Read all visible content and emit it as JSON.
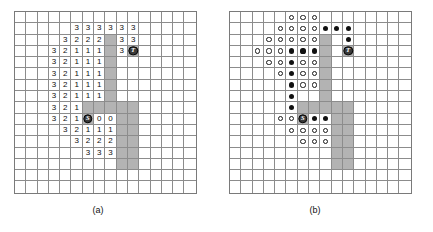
{
  "figure": {
    "panels": [
      {
        "id": "a",
        "caption": "(a)",
        "grid": {
          "cols": 16,
          "rows": 16,
          "cells": [
            [
              null,
              null,
              null,
              null,
              null,
              null,
              null,
              null,
              null,
              null,
              null,
              null,
              null,
              null,
              null,
              null
            ],
            [
              null,
              null,
              null,
              null,
              null,
              "3",
              "3",
              "3",
              "3",
              "3",
              "3",
              null,
              null,
              null,
              null,
              null
            ],
            [
              null,
              null,
              null,
              null,
              "3",
              "2",
              "2",
              "2",
              "#",
              "3",
              "3",
              null,
              null,
              null,
              null,
              null
            ],
            [
              null,
              null,
              null,
              "3",
              "2",
              "1",
              "1",
              "1",
              "#",
              "3",
              "T",
              null,
              null,
              null,
              null,
              null
            ],
            [
              null,
              null,
              null,
              "3",
              "2",
              "1",
              "1",
              "1",
              "#",
              null,
              null,
              null,
              null,
              null,
              null,
              null
            ],
            [
              null,
              null,
              null,
              "3",
              "2",
              "1",
              "1",
              "1",
              "#",
              null,
              null,
              null,
              null,
              null,
              null,
              null
            ],
            [
              null,
              null,
              null,
              "3",
              "2",
              "1",
              "1",
              "1",
              "#",
              null,
              null,
              null,
              null,
              null,
              null,
              null
            ],
            [
              null,
              null,
              null,
              "3",
              "2",
              "1",
              "1",
              "1",
              "#",
              null,
              null,
              null,
              null,
              null,
              null,
              null
            ],
            [
              null,
              null,
              null,
              "3",
              "2",
              "1",
              "#",
              "#",
              "#",
              "#",
              "#",
              null,
              null,
              null,
              null,
              null
            ],
            [
              null,
              null,
              null,
              "3",
              "2",
              "1",
              "S",
              "0",
              "0",
              "#",
              "#",
              null,
              null,
              null,
              null,
              null
            ],
            [
              null,
              null,
              null,
              null,
              "3",
              "2",
              "1",
              "1",
              "1",
              "#",
              "#",
              null,
              null,
              null,
              null,
              null
            ],
            [
              null,
              null,
              null,
              null,
              null,
              "3",
              "2",
              "2",
              "2",
              "#",
              "#",
              null,
              null,
              null,
              null,
              null
            ],
            [
              null,
              null,
              null,
              null,
              null,
              null,
              "3",
              "3",
              "3",
              "#",
              "#",
              null,
              null,
              null,
              null,
              null
            ],
            [
              null,
              null,
              null,
              null,
              null,
              null,
              null,
              null,
              null,
              "#",
              "#",
              null,
              null,
              null,
              null,
              null
            ],
            [
              null,
              null,
              null,
              null,
              null,
              null,
              null,
              null,
              null,
              null,
              null,
              null,
              null,
              null,
              null,
              null
            ],
            [
              null,
              null,
              null,
              null,
              null,
              null,
              null,
              null,
              null,
              null,
              null,
              null,
              null,
              null,
              null,
              null
            ]
          ]
        }
      },
      {
        "id": "b",
        "caption": "(b)",
        "grid": {
          "cols": 16,
          "rows": 16,
          "cells": [
            [
              null,
              null,
              null,
              null,
              null,
              "o",
              "o",
              "o",
              null,
              null,
              null,
              null,
              null,
              null,
              null,
              null
            ],
            [
              null,
              null,
              null,
              null,
              "o",
              "o",
              "o",
              "o",
              "*",
              "*",
              "*",
              null,
              null,
              null,
              null,
              null
            ],
            [
              null,
              null,
              null,
              "o",
              "o",
              "o",
              "o",
              "o",
              "#",
              null,
              "*",
              null,
              null,
              null,
              null,
              null
            ],
            [
              null,
              null,
              "o",
              "o",
              "o",
              "*",
              "*",
              "*",
              "#",
              null,
              "T",
              null,
              null,
              null,
              null,
              null
            ],
            [
              null,
              null,
              null,
              "o",
              "o",
              "*",
              "o",
              "o",
              "#",
              null,
              null,
              null,
              null,
              null,
              null,
              null
            ],
            [
              null,
              null,
              null,
              null,
              "o",
              "*",
              "o",
              "o",
              "#",
              null,
              null,
              null,
              null,
              null,
              null,
              null
            ],
            [
              null,
              null,
              null,
              null,
              null,
              "*",
              "o",
              "o",
              "#",
              null,
              null,
              null,
              null,
              null,
              null,
              null
            ],
            [
              null,
              null,
              null,
              null,
              null,
              "*",
              null,
              null,
              "#",
              null,
              null,
              null,
              null,
              null,
              null,
              null
            ],
            [
              null,
              null,
              null,
              null,
              null,
              "*",
              "#",
              "#",
              "#",
              "#",
              "#",
              null,
              null,
              null,
              null,
              null
            ],
            [
              null,
              null,
              null,
              null,
              "o",
              "o",
              "S",
              "*",
              "*",
              "#",
              "#",
              null,
              null,
              null,
              null,
              null
            ],
            [
              null,
              null,
              null,
              null,
              null,
              "o",
              "o",
              "o",
              "o",
              "#",
              "#",
              null,
              null,
              null,
              null,
              null
            ],
            [
              null,
              null,
              null,
              null,
              null,
              null,
              "o",
              "o",
              "o",
              "#",
              "#",
              null,
              null,
              null,
              null,
              null
            ],
            [
              null,
              null,
              null,
              null,
              null,
              null,
              null,
              null,
              null,
              "#",
              "#",
              null,
              null,
              null,
              null,
              null
            ],
            [
              null,
              null,
              null,
              null,
              null,
              null,
              null,
              null,
              null,
              "#",
              "#",
              null,
              null,
              null,
              null,
              null
            ],
            [
              null,
              null,
              null,
              null,
              null,
              null,
              null,
              null,
              null,
              null,
              null,
              null,
              null,
              null,
              null,
              null
            ],
            [
              null,
              null,
              null,
              null,
              null,
              null,
              null,
              null,
              null,
              null,
              null,
              null,
              null,
              null,
              null,
              null
            ]
          ]
        }
      }
    ],
    "legend": {
      "start_label": "S",
      "target_label": "T",
      "obstacle_token": "#",
      "open_node_token": "o",
      "closed_node_token": "*"
    },
    "colors": {
      "obstacle": "#b3b3b3",
      "grid_line": "#8c8c8c",
      "border": "#7a7a7a",
      "node_fill": "#3a3a3a",
      "text": "#111111"
    }
  }
}
